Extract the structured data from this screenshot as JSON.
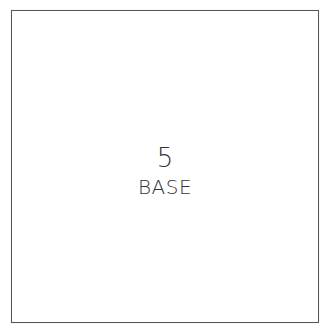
{
  "card": {
    "number": "5",
    "label": "BASE",
    "border_color": "#555555",
    "text_color": "#333333"
  }
}
